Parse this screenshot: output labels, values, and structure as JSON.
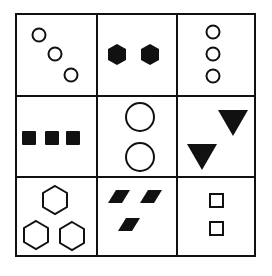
{
  "puzzle": {
    "type": "3x3 figure reasoning matrix",
    "colors": {
      "stroke": "#111111",
      "fill": "#111111",
      "background": "#ffffff"
    },
    "cells": [
      {
        "row": 1,
        "col": 1,
        "shape": "circle",
        "fill": "outline",
        "count": 3,
        "arrangement": "diagonal"
      },
      {
        "row": 1,
        "col": 2,
        "shape": "hexagon",
        "fill": "solid",
        "count": 2,
        "arrangement": "horizontal"
      },
      {
        "row": 1,
        "col": 3,
        "shape": "circle",
        "fill": "outline",
        "count": 3,
        "arrangement": "vertical"
      },
      {
        "row": 2,
        "col": 1,
        "shape": "square",
        "fill": "solid",
        "count": 3,
        "arrangement": "horizontal"
      },
      {
        "row": 2,
        "col": 2,
        "shape": "circle",
        "fill": "outline",
        "count": 2,
        "arrangement": "vertical"
      },
      {
        "row": 2,
        "col": 3,
        "shape": "triangle-down",
        "fill": "solid",
        "count": 2,
        "arrangement": "diagonal"
      },
      {
        "row": 3,
        "col": 1,
        "shape": "hexagon",
        "fill": "outline",
        "count": 3,
        "arrangement": "triangle"
      },
      {
        "row": 3,
        "col": 2,
        "shape": "parallelogram",
        "fill": "solid",
        "count": 3,
        "arrangement": "triangle"
      },
      {
        "row": 3,
        "col": 3,
        "shape": "square",
        "fill": "outline",
        "count": 2,
        "arrangement": "vertical"
      }
    ]
  }
}
